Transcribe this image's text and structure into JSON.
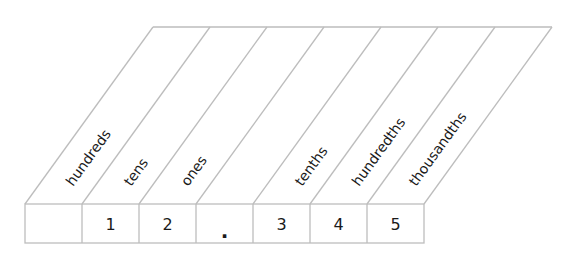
{
  "place_value_chart": {
    "columns": [
      {
        "label": "hundreds",
        "digit": ""
      },
      {
        "label": "tens",
        "digit": "1"
      },
      {
        "label": "ones",
        "digit": "2"
      },
      {
        "label": "",
        "digit": "."
      },
      {
        "label": "tenths",
        "digit": "3"
      },
      {
        "label": "hundredths",
        "digit": "4"
      },
      {
        "label": "thousandths",
        "digit": "5"
      }
    ],
    "line_color": "#bdbdbd",
    "text_color": "#1a1a1a"
  }
}
